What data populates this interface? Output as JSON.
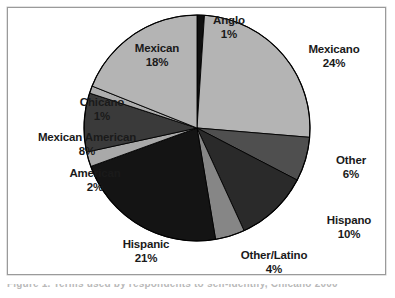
{
  "figure": {
    "background_color": "#ffffff",
    "frame_border_color": "#9a9a9a",
    "caption_partial": "Figure 1. Terms used by respondents to self-identify, Chicano 2000"
  },
  "chart_data": {
    "type": "pie",
    "title": "",
    "subtitle": "",
    "xlabel": "",
    "ylabel": "",
    "grid": false,
    "legend_position": "none",
    "label_format": "name-above-percent",
    "start_angle_deg": 0,
    "direction": "clockwise",
    "units": "percent",
    "total": 95,
    "categories": [
      "Anglo",
      "Mexicano",
      "Other",
      "Hispano",
      "Other/Latino",
      "Hispanic",
      "American",
      "Mexican American",
      "Chicano",
      "Mexican"
    ],
    "values": [
      1,
      24,
      6,
      10,
      4,
      21,
      2,
      8,
      1,
      18
    ],
    "value_labels": [
      "1%",
      "24%",
      "6%",
      "10%",
      "4%",
      "21%",
      "2%",
      "8%",
      "1%",
      "18%"
    ],
    "colors": [
      "#101010",
      "#b4b4b4",
      "#4f4f4f",
      "#2a2a2a",
      "#868686",
      "#141414",
      "#a9a9a9",
      "#3a3a3a",
      "#aeaeae",
      "#b4b4b4"
    ],
    "slice_edge_color": "#000000",
    "slices": [
      {
        "name": "Anglo",
        "value": 1,
        "label": "Anglo",
        "percent": "1%",
        "color": "#101010"
      },
      {
        "name": "Mexicano",
        "value": 24,
        "label": "Mexicano",
        "percent": "24%",
        "color": "#b4b4b4"
      },
      {
        "name": "Other",
        "value": 6,
        "label": "Other",
        "percent": "6%",
        "color": "#4f4f4f"
      },
      {
        "name": "Hispano",
        "value": 10,
        "label": "Hispano",
        "percent": "10%",
        "color": "#2a2a2a"
      },
      {
        "name": "Other/Latino",
        "value": 4,
        "label": "Other/Latino",
        "percent": "4%",
        "color": "#868686"
      },
      {
        "name": "Hispanic",
        "value": 21,
        "label": "Hispanic",
        "percent": "21%",
        "color": "#141414"
      },
      {
        "name": "American",
        "value": 2,
        "label": "American",
        "percent": "2%",
        "color": "#a9a9a9"
      },
      {
        "name": "Mexican American",
        "value": 8,
        "label": "Mexican American",
        "percent": "8%",
        "color": "#3a3a3a"
      },
      {
        "name": "Chicano",
        "value": 1,
        "label": "Chicano",
        "percent": "1%",
        "color": "#aeaeae"
      },
      {
        "name": "Mexican",
        "value": 18,
        "label": "Mexican",
        "percent": "18%",
        "color": "#b4b4b4"
      }
    ]
  }
}
